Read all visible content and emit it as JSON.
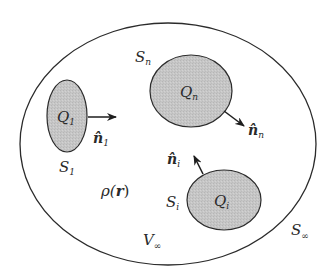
{
  "diagram": {
    "title": "",
    "colors": {
      "background": "#ffffff",
      "stroke": "#2b2b2b",
      "conductor_fill": "#c4c4c4",
      "text": "#2a2a2a"
    },
    "outer_region": {
      "surface_label": "S",
      "surface_sub": "∞",
      "volume_label": "V",
      "volume_sub": "∞",
      "charge_density_label": "ρ(",
      "charge_density_var": "r",
      "charge_density_close": ")"
    },
    "conductors": [
      {
        "id": "1",
        "charge_label": "Q",
        "charge_sub": "1",
        "surface_label": "S",
        "surface_sub": "1",
        "normal_label": "n̂",
        "normal_sub": "1"
      },
      {
        "id": "n",
        "charge_label": "Q",
        "charge_sub": "n",
        "surface_label": "S",
        "surface_sub": "n",
        "normal_label": "n̂",
        "normal_sub": "n"
      },
      {
        "id": "i",
        "charge_label": "Q",
        "charge_sub": "i",
        "surface_label": "S",
        "surface_sub": "i",
        "normal_label": "n̂",
        "normal_sub": "i"
      }
    ]
  }
}
